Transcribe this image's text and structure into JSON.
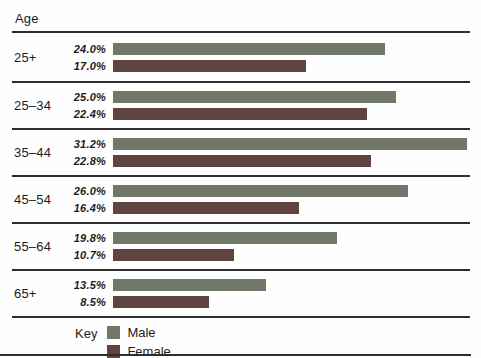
{
  "header": {
    "age_label": "Age"
  },
  "legend": {
    "key_label": "Key",
    "male_label": "Male",
    "female_label": "Female"
  },
  "colors": {
    "male_bar": "#70786a",
    "female_bar": "#60443f",
    "rule_line": "#2d2d2d"
  },
  "chart_data": {
    "type": "bar",
    "orientation": "horizontal",
    "title": "",
    "axis_header": "Age",
    "categories": [
      "25+",
      "25–34",
      "35–44",
      "45–54",
      "55–64",
      "65+"
    ],
    "series": [
      {
        "name": "Male",
        "color": "#70786a",
        "values": [
          24.0,
          25.0,
          31.2,
          26.0,
          19.8,
          13.5
        ],
        "labels": [
          "24.0%",
          "25.0%",
          "31.2%",
          "26.0%",
          "19.8%",
          "13.5%"
        ]
      },
      {
        "name": "Female",
        "color": "#60443f",
        "values": [
          17.0,
          22.4,
          22.8,
          16.4,
          10.7,
          8.5
        ],
        "labels": [
          "17.0%",
          "22.4%",
          "22.8%",
          "16.4%",
          "10.7%",
          "8.5%"
        ]
      }
    ],
    "unit": "%",
    "xlim": [
      0,
      31.5
    ],
    "grid": false,
    "value_labels_position": "left-of-bar",
    "legend_position": "bottom",
    "legend_key_label": "Key"
  }
}
